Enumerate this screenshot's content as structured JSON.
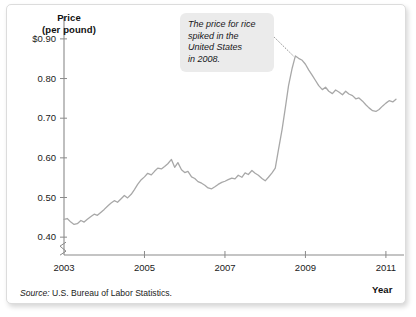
{
  "figure": {
    "callout_note": "The price for rice\nspiked in the\nUnited States\nin 2008.",
    "source_label": "Source:",
    "source_text": " U.S. Bureau of Labor Statistics.",
    "line_color": "#a8a8a8",
    "axis_color": "#8a8a8a",
    "callout_bg": "#ebebeb"
  },
  "chart_data": {
    "type": "line",
    "title": "",
    "subtitle": "",
    "xlabel": "Year",
    "ylabel": "Price (per pound)",
    "ylabel_line1": "Price",
    "ylabel_line2": "(per pound)",
    "grid": false,
    "legend_position": "none",
    "y_axis_break": true,
    "y_axis_break_note": "axis broken below 0.40",
    "xlim": [
      2003,
      2011.35
    ],
    "ylim": [
      0.355,
      0.935
    ],
    "xticks": [
      2003,
      2005,
      2007,
      2009,
      2011
    ],
    "xtick_labels": [
      "2003",
      "2005",
      "2007",
      "2009",
      "2011"
    ],
    "yticks": [
      0.4,
      0.5,
      0.6,
      0.7,
      0.8,
      0.9
    ],
    "ytick_labels": [
      "0.40",
      "0.50",
      "0.60",
      "0.70",
      "0.80",
      "$0.90"
    ],
    "annotations": [
      {
        "text": "The price for rice spiked in the United States in 2008.",
        "points_to_x": 2008.7,
        "points_to_y": 0.857
      }
    ],
    "series": [
      {
        "name": "Rice price (per pound)",
        "x": [
          2003.0,
          2003.08,
          2003.17,
          2003.25,
          2003.33,
          2003.42,
          2003.5,
          2003.58,
          2003.67,
          2003.75,
          2003.83,
          2003.92,
          2004.0,
          2004.08,
          2004.17,
          2004.25,
          2004.33,
          2004.42,
          2004.5,
          2004.58,
          2004.67,
          2004.75,
          2004.83,
          2004.92,
          2005.0,
          2005.08,
          2005.17,
          2005.25,
          2005.33,
          2005.42,
          2005.5,
          2005.58,
          2005.67,
          2005.75,
          2005.83,
          2005.92,
          2006.0,
          2006.08,
          2006.17,
          2006.25,
          2006.33,
          2006.42,
          2006.5,
          2006.58,
          2006.67,
          2006.75,
          2006.83,
          2006.92,
          2007.0,
          2007.08,
          2007.17,
          2007.25,
          2007.33,
          2007.42,
          2007.5,
          2007.58,
          2007.67,
          2007.75,
          2007.83,
          2007.92,
          2008.0,
          2008.08,
          2008.17,
          2008.25,
          2008.33,
          2008.42,
          2008.5,
          2008.58,
          2008.67,
          2008.75,
          2008.83,
          2008.92,
          2009.0,
          2009.08,
          2009.17,
          2009.25,
          2009.33,
          2009.42,
          2009.5,
          2009.58,
          2009.67,
          2009.75,
          2009.83,
          2009.92,
          2010.0,
          2010.08,
          2010.17,
          2010.25,
          2010.33,
          2010.42,
          2010.5,
          2010.58,
          2010.67,
          2010.75,
          2010.83,
          2010.92,
          2011.0,
          2011.08,
          2011.17,
          2011.25
        ],
        "values": [
          0.445,
          0.447,
          0.438,
          0.432,
          0.434,
          0.442,
          0.438,
          0.445,
          0.452,
          0.458,
          0.455,
          0.463,
          0.47,
          0.478,
          0.486,
          0.492,
          0.488,
          0.497,
          0.505,
          0.499,
          0.508,
          0.52,
          0.533,
          0.545,
          0.552,
          0.561,
          0.557,
          0.566,
          0.574,
          0.572,
          0.578,
          0.585,
          0.596,
          0.576,
          0.588,
          0.57,
          0.563,
          0.566,
          0.552,
          0.548,
          0.54,
          0.536,
          0.531,
          0.524,
          0.522,
          0.527,
          0.533,
          0.538,
          0.541,
          0.545,
          0.549,
          0.547,
          0.556,
          0.551,
          0.562,
          0.558,
          0.568,
          0.561,
          0.556,
          0.548,
          0.542,
          0.551,
          0.562,
          0.574,
          0.621,
          0.672,
          0.726,
          0.782,
          0.826,
          0.857,
          0.851,
          0.846,
          0.836,
          0.822,
          0.808,
          0.795,
          0.782,
          0.772,
          0.778,
          0.768,
          0.762,
          0.771,
          0.766,
          0.759,
          0.768,
          0.761,
          0.757,
          0.749,
          0.751,
          0.743,
          0.734,
          0.726,
          0.719,
          0.717,
          0.722,
          0.731,
          0.738,
          0.744,
          0.741,
          0.748
        ]
      }
    ]
  }
}
